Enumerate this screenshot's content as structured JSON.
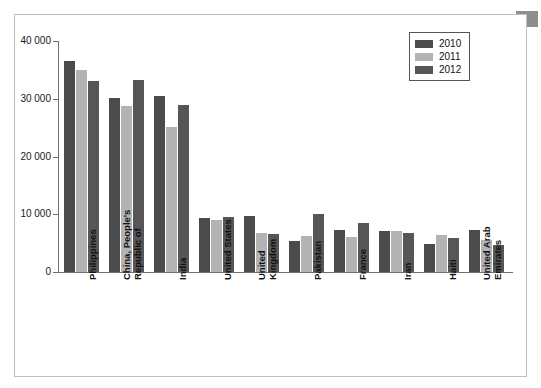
{
  "chart_data": {
    "type": "bar",
    "title": "",
    "subtitle": "",
    "xlabel": "",
    "ylabel": "",
    "ylim": [
      0,
      40000
    ],
    "grid": false,
    "legend_position": "top-right",
    "y_ticks": [
      "0",
      "10 000",
      "20 000",
      "30 000",
      "40 000"
    ],
    "y_tick_values": [
      0,
      10000,
      20000,
      30000,
      40000
    ],
    "categories": [
      "Philippines",
      "China, People's Republic of",
      "India",
      "United States",
      "United Kingdom",
      "Pakistan",
      "France",
      "Iran",
      "Haiti",
      "United Arab Emirates"
    ],
    "category_lines": [
      [
        "Philippines"
      ],
      [
        "China, People's",
        "Republic of"
      ],
      [
        "India"
      ],
      [
        "United States"
      ],
      [
        "United",
        "Kingdom"
      ],
      [
        "Pakistan"
      ],
      [
        "France"
      ],
      [
        "Iran"
      ],
      [
        "Haiti"
      ],
      [
        "United Arab",
        "Emirates"
      ]
    ],
    "series": [
      {
        "name": "2010",
        "color": "#4b4b4b",
        "values": [
          36500,
          30200,
          30400,
          9400,
          9700,
          5300,
          7200,
          7100,
          4900,
          7200
        ]
      },
      {
        "name": "2011",
        "color": "#b3b3b3",
        "values": [
          35000,
          28700,
          25100,
          9000,
          6700,
          6200,
          6000,
          7100,
          6400,
          5500
        ]
      },
      {
        "name": "2012",
        "color": "#565656",
        "values": [
          33000,
          33300,
          29000,
          9500,
          6500,
          10100,
          8500,
          6800,
          5900,
          4700
        ]
      }
    ]
  },
  "legend": {
    "entries": [
      {
        "label": "2010",
        "color": "#4b4b4b"
      },
      {
        "label": "2011",
        "color": "#b3b3b3"
      },
      {
        "label": "2012",
        "color": "#565656"
      }
    ]
  }
}
